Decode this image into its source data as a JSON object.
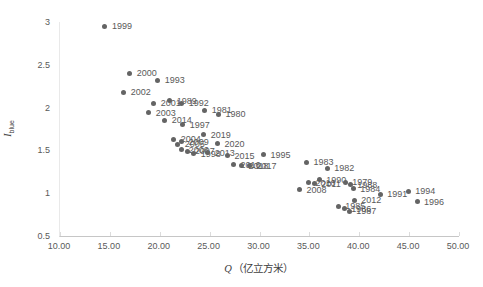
{
  "chart_data": {
    "type": "scatter",
    "title": "",
    "xlabel_variable": "Q",
    "xlabel_unit": "（亿立方米）",
    "ylabel_variable": "I",
    "ylabel_subscript": "blue",
    "xlim": [
      10,
      50
    ],
    "ylim": [
      0.5,
      3
    ],
    "x_tick_values": [
      10,
      15,
      20,
      25,
      30,
      35,
      40,
      45,
      50
    ],
    "x_tick_labels": [
      "10.00",
      "15.00",
      "20.00",
      "25.00",
      "30.00",
      "35.00",
      "40.00",
      "45.00",
      "50.00"
    ],
    "y_tick_values": [
      0.5,
      1,
      1.5,
      2,
      2.5,
      3
    ],
    "y_tick_labels": [
      "0.5",
      "1",
      "1.5",
      "2",
      "2.5",
      "3"
    ],
    "grid": false,
    "legend": false,
    "marker_color": "#646464",
    "data_label_color": "#595959",
    "axis_color": "#c6c6c6",
    "points": [
      {
        "year": "1999",
        "q": 14.5,
        "i": 2.95
      },
      {
        "year": "2000",
        "q": 17.0,
        "i": 2.4
      },
      {
        "year": "1993",
        "q": 19.8,
        "i": 2.32
      },
      {
        "year": "2002",
        "q": 16.4,
        "i": 2.18
      },
      {
        "year": "2001",
        "q": 19.4,
        "i": 2.05
      },
      {
        "year": "1989",
        "q": 21.0,
        "i": 2.08
      },
      {
        "year": "1992",
        "q": 22.2,
        "i": 2.05
      },
      {
        "year": "2003",
        "q": 18.9,
        "i": 1.94
      },
      {
        "year": "1981",
        "q": 24.5,
        "i": 1.97
      },
      {
        "year": "1980",
        "q": 25.9,
        "i": 1.92
      },
      {
        "year": "2014",
        "q": 20.5,
        "i": 1.85
      },
      {
        "year": "1997",
        "q": 22.3,
        "i": 1.8
      },
      {
        "year": "2019",
        "q": 24.4,
        "i": 1.68
      },
      {
        "year": "2004",
        "q": 21.4,
        "i": 1.63
      },
      {
        "year": "2009",
        "q": 22.2,
        "i": 1.6
      },
      {
        "year": "2005",
        "q": 21.8,
        "i": 1.57
      },
      {
        "year": "2020",
        "q": 25.8,
        "i": 1.58
      },
      {
        "year": "2006",
        "q": 22.2,
        "i": 1.51
      },
      {
        "year": "2007",
        "q": 22.8,
        "i": 1.49
      },
      {
        "year": "1998",
        "q": 23.4,
        "i": 1.46
      },
      {
        "year": "2013",
        "q": 24.8,
        "i": 1.47
      },
      {
        "year": "2015",
        "q": 26.8,
        "i": 1.44
      },
      {
        "year": "1995",
        "q": 30.4,
        "i": 1.45
      },
      {
        "year": "2016",
        "q": 27.4,
        "i": 1.33
      },
      {
        "year": "2018",
        "q": 28.2,
        "i": 1.32
      },
      {
        "year": "2017",
        "q": 29.0,
        "i": 1.32
      },
      {
        "year": "1983",
        "q": 34.7,
        "i": 1.36
      },
      {
        "year": "1982",
        "q": 36.8,
        "i": 1.29
      },
      {
        "year": "1990",
        "q": 36.0,
        "i": 1.16
      },
      {
        "year": "2010",
        "q": 34.9,
        "i": 1.12
      },
      {
        "year": "2011",
        "q": 35.5,
        "i": 1.11
      },
      {
        "year": "1979",
        "q": 38.6,
        "i": 1.13
      },
      {
        "year": "1988",
        "q": 39.1,
        "i": 1.1
      },
      {
        "year": "2008",
        "q": 34.0,
        "i": 1.04
      },
      {
        "year": "1984",
        "q": 39.4,
        "i": 1.05
      },
      {
        "year": "1985",
        "q": 37.9,
        "i": 0.85
      },
      {
        "year": "1986",
        "q": 38.5,
        "i": 0.82
      },
      {
        "year": "1987",
        "q": 39.0,
        "i": 0.79
      },
      {
        "year": "2012",
        "q": 39.5,
        "i": 0.92
      },
      {
        "year": "1991",
        "q": 42.1,
        "i": 0.99
      },
      {
        "year": "1994",
        "q": 44.9,
        "i": 1.02
      },
      {
        "year": "1996",
        "q": 45.8,
        "i": 0.9
      }
    ]
  }
}
